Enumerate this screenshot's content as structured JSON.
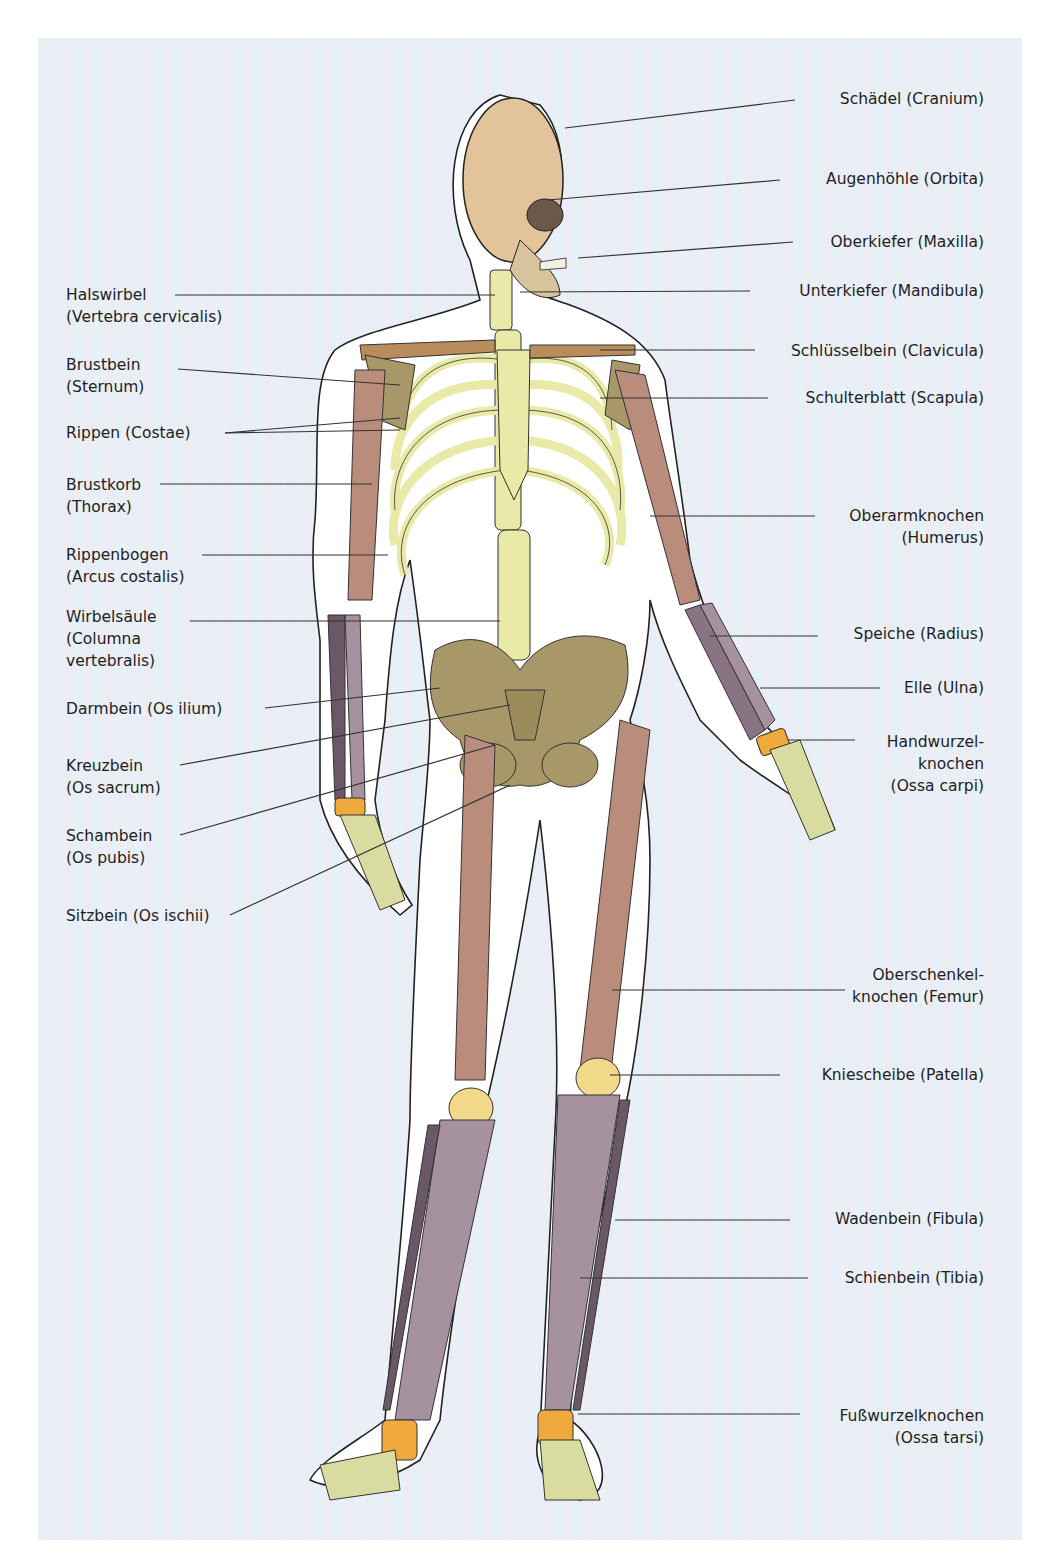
{
  "diagram": {
    "type": "labeled-anatomy-illustration",
    "colors": {
      "background_panel": "#e8eff6",
      "body_outline_fill": "#ffffff",
      "axial_bones": "#e9e9a8",
      "cranium": "#e2c39a",
      "shoulder_pelvis": "#a89768",
      "long_bones_upper": "#b98c7c",
      "forearm_lower_leg": "#a6929f",
      "patella": "#f2d98a",
      "carpals_tarsals": "#f0a93c",
      "label_text": "#1e1e1e",
      "leader_line": "#333333"
    },
    "labels_right": [
      {
        "id": "cranium",
        "text": "Schädel (Cranium)",
        "lines": [
          "Schädel (Cranium)"
        ]
      },
      {
        "id": "orbita",
        "text": "Augenhöhle (Orbita)",
        "lines": [
          "Augenhöhle (Orbita)"
        ]
      },
      {
        "id": "maxilla",
        "text": "Oberkiefer (Maxilla)",
        "lines": [
          "Oberkiefer (Maxilla)"
        ]
      },
      {
        "id": "mandibula",
        "text": "Unterkiefer (Mandibula)",
        "lines": [
          "Unterkiefer (Mandibula)"
        ]
      },
      {
        "id": "clavicula",
        "text": "Schlüsselbein (Clavicula)",
        "lines": [
          "Schlüsselbein (Clavicula)"
        ]
      },
      {
        "id": "scapula",
        "text": "Schulterblatt (Scapula)",
        "lines": [
          "Schulterblatt (Scapula)"
        ]
      },
      {
        "id": "humerus",
        "text": "Oberarmknochen (Humerus)",
        "lines": [
          "Oberarmknochen",
          "(Humerus)"
        ]
      },
      {
        "id": "radius",
        "text": "Speiche (Radius)",
        "lines": [
          "Speiche (Radius)"
        ]
      },
      {
        "id": "ulna",
        "text": "Elle (Ulna)",
        "lines": [
          "Elle (Ulna)"
        ]
      },
      {
        "id": "carpi",
        "text": "Handwurzelknochen (Ossa carpi)",
        "lines": [
          "Handwurzel-",
          "knochen",
          "(Ossa carpi)"
        ]
      },
      {
        "id": "femur",
        "text": "Oberschenkelknochen (Femur)",
        "lines": [
          "Oberschenkel-",
          "knochen (Femur)"
        ]
      },
      {
        "id": "patella",
        "text": "Kniescheibe (Patella)",
        "lines": [
          "Kniescheibe (Patella)"
        ]
      },
      {
        "id": "fibula",
        "text": "Wadenbein (Fibula)",
        "lines": [
          "Wadenbein (Fibula)"
        ]
      },
      {
        "id": "tibia",
        "text": "Schienbein (Tibia)",
        "lines": [
          "Schienbein (Tibia)"
        ]
      },
      {
        "id": "tarsi",
        "text": "Fußwurzelknochen (Ossa tarsi)",
        "lines": [
          "Fußwurzelknochen",
          "(Ossa tarsi)"
        ]
      }
    ],
    "labels_left": [
      {
        "id": "cervicalis",
        "text": "Halswirbel (Vertebra cervicalis)",
        "lines": [
          "Halswirbel",
          "(Vertebra cervicalis)"
        ]
      },
      {
        "id": "sternum",
        "text": "Brustbein (Sternum)",
        "lines": [
          "Brustbein",
          "(Sternum)"
        ]
      },
      {
        "id": "costae",
        "text": "Rippen (Costae)",
        "lines": [
          "Rippen (Costae)"
        ]
      },
      {
        "id": "thorax",
        "text": "Brustkorb (Thorax)",
        "lines": [
          "Brustkorb",
          "(Thorax)"
        ]
      },
      {
        "id": "arcus",
        "text": "Rippenbogen (Arcus costalis)",
        "lines": [
          "Rippenbogen",
          "(Arcus costalis)"
        ]
      },
      {
        "id": "columna",
        "text": "Wirbelsäule (Columna vertebralis)",
        "lines": [
          "Wirbelsäule",
          "(Columna",
          "vertebralis)"
        ]
      },
      {
        "id": "ilium",
        "text": "Darmbein (Os ilium)",
        "lines": [
          "Darmbein (Os ilium)"
        ]
      },
      {
        "id": "sacrum",
        "text": "Kreuzbein (Os sacrum)",
        "lines": [
          "Kreuzbein",
          "(Os sacrum)"
        ]
      },
      {
        "id": "pubis",
        "text": "Schambein (Os pubis)",
        "lines": [
          "Schambein",
          "(Os pubis)"
        ]
      },
      {
        "id": "ischii",
        "text": "Sitzbein (Os ischii)",
        "lines": [
          "Sitzbein (Os ischii)"
        ]
      }
    ]
  }
}
